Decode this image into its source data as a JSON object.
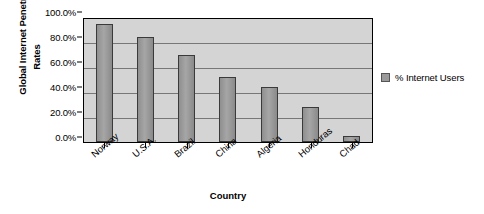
{
  "chart_data": {
    "type": "bar",
    "title": "",
    "categories": [
      "Norway",
      "U.S.A.",
      "Brazil",
      "China",
      "Algeria",
      "Honduras",
      "Chad"
    ],
    "values": [
      96.0,
      85.0,
      71.0,
      53.0,
      44.5,
      28.5,
      4.5
    ],
    "series": [
      {
        "name": "% Internet Users",
        "values": [
          96.0,
          85.0,
          71.0,
          53.0,
          44.5,
          28.5,
          4.5
        ]
      }
    ],
    "xlabel": "Country",
    "ylabel": "Global Internet Penetration Rates",
    "ylabel_line1": "Global Internet Penetration",
    "ylabel_line2": "Rates",
    "ylim": [
      0,
      100
    ],
    "ytick_labels": [
      "100.0%",
      "80.0%",
      "60.0%",
      "40.0%",
      "20.0%",
      "0.0%"
    ],
    "ytick_values": [
      100,
      80,
      60,
      40,
      20,
      0
    ],
    "grid": true,
    "legend": {
      "position": "right",
      "entries": [
        "% Internet Users"
      ]
    },
    "colors": {
      "bar_fill": "#9a9a9a",
      "bar_stroke": "#3a3a3a",
      "plot_background": "#d4d4d4",
      "gridline": "#777777",
      "axis": "#000000",
      "page_background": "#ffffff",
      "text": "#000000"
    }
  }
}
